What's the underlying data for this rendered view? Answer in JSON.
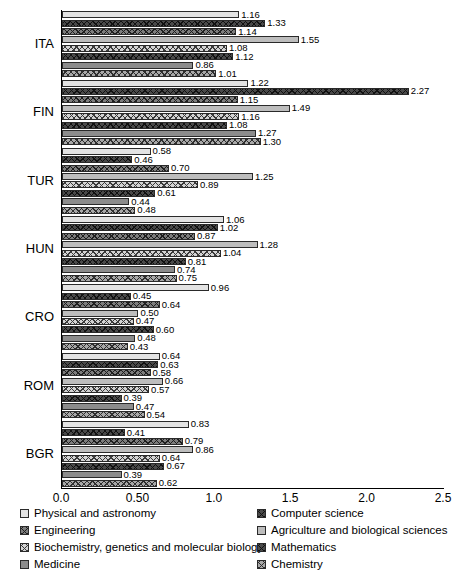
{
  "chart_data": {
    "type": "bar",
    "orientation": "horizontal",
    "title": "",
    "xlabel": "",
    "ylabel": "",
    "xlim": [
      0.0,
      2.5
    ],
    "xticks": [
      0.0,
      0.5,
      1.0,
      1.5,
      2.0,
      2.5
    ],
    "xtick_labels": [
      "0.0",
      "0.50",
      "1.0",
      "1.5",
      "2.0",
      "2.5"
    ],
    "grid": false,
    "legend_position": "below",
    "categories": [
      "ITA",
      "FIN",
      "TUR",
      "HUN",
      "CRO",
      "ROM",
      "BGR"
    ],
    "series": [
      {
        "name": "Physical and astronomy",
        "pattern": "solid-light",
        "color": "#e3e3e3",
        "values": [
          1.16,
          1.22,
          0.58,
          1.06,
          0.96,
          0.64,
          0.83
        ]
      },
      {
        "name": "Computer science",
        "pattern": "cross-hatch-dark",
        "color": "#4a4a4a",
        "values": [
          1.33,
          2.27,
          0.46,
          1.02,
          0.45,
          0.63,
          0.41
        ]
      },
      {
        "name": "Engineering",
        "pattern": "cross-hatch-medium-dark",
        "color": "#7d7d7d",
        "values": [
          1.14,
          1.15,
          0.7,
          0.87,
          0.64,
          0.58,
          0.79
        ]
      },
      {
        "name": "Agriculture and biological sciences",
        "pattern": "solid-medium-light",
        "color": "#bdbdbd",
        "values": [
          1.55,
          1.49,
          1.25,
          1.28,
          0.5,
          0.66,
          0.86
        ]
      },
      {
        "name": "Biochemistry, genetics and molecular biology",
        "pattern": "cross-hatch-light",
        "color": "#d3d3d3",
        "values": [
          1.08,
          1.16,
          0.89,
          1.04,
          0.47,
          0.57,
          0.64
        ]
      },
      {
        "name": "Mathematics",
        "pattern": "cross-hatch-darkest",
        "color": "#4a4a4a",
        "values": [
          1.12,
          1.08,
          0.61,
          0.81,
          0.6,
          0.39,
          0.67
        ]
      },
      {
        "name": "Medicine",
        "pattern": "solid-medium",
        "color": "#8c8c8c",
        "values": [
          0.86,
          1.27,
          0.44,
          0.74,
          0.48,
          0.47,
          0.39
        ]
      },
      {
        "name": "Chemistry",
        "pattern": "cross-hatch-medium",
        "color": "#a8a8a8",
        "values": [
          1.01,
          1.3,
          0.48,
          0.75,
          0.43,
          0.54,
          0.62
        ]
      }
    ]
  },
  "legend": {
    "left_column": [
      "Physical and astronomy",
      "Engineering",
      "Biochemistry, genetics and molecular biology",
      "Medicine"
    ],
    "right_column": [
      "Computer science",
      "Agriculture and biological sciences",
      "Mathematics",
      "Chemistry"
    ]
  }
}
